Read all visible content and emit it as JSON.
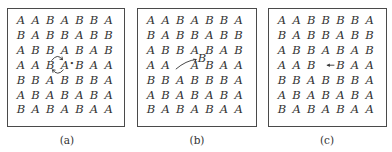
{
  "panels": [
    {
      "id": "a",
      "caption": "(a)",
      "description": "Direct exchange of neighboring B and A atoms (circular arrow)",
      "grid": [
        [
          "A",
          "A",
          "B",
          "A",
          "B",
          "B",
          "A"
        ],
        [
          "B",
          "A",
          "B",
          "B",
          "A",
          "B",
          "B"
        ],
        [
          "A",
          "B",
          "B",
          "A",
          "B",
          "A",
          "B"
        ],
        [
          "A",
          "A",
          "B",
          "A",
          "B",
          "A",
          "A"
        ],
        [
          "B",
          "B",
          "A",
          "B",
          "B",
          "B",
          "A"
        ],
        [
          "A",
          "B",
          "A",
          "B",
          "A",
          "B",
          "A"
        ],
        [
          "B",
          "A",
          "B",
          "A",
          "B",
          "A",
          "A"
        ]
      ],
      "marker": "•",
      "annotation": "exchange-arrow"
    },
    {
      "id": "b",
      "caption": "(b)",
      "description": "Interstitial mechanism: atom moves from lattice site to interstitial position",
      "grid": [
        [
          "A",
          "A",
          "B",
          "A",
          "B",
          "B",
          "A"
        ],
        [
          "B",
          "A",
          "B",
          "B",
          "A",
          "B",
          "B"
        ],
        [
          "A",
          "B",
          "B",
          "A",
          "B",
          "A",
          "B"
        ],
        [
          "A",
          "A",
          "",
          "A",
          "B",
          "A",
          "A"
        ],
        [
          "B",
          "B",
          "A",
          "B",
          "B",
          "B",
          "A"
        ],
        [
          "A",
          "B",
          "A",
          "B",
          "A",
          "B",
          "A"
        ],
        [
          "B",
          "A",
          "B",
          "A",
          "B",
          "A",
          "A"
        ]
      ],
      "interstitial": "B",
      "annotation": "interstitial-arrow"
    },
    {
      "id": "c",
      "caption": "(c)",
      "description": "Vacancy mechanism: B atom jumps into neighboring vacancy",
      "grid": [
        [
          "A",
          "A",
          "B",
          "B",
          "B",
          "B",
          "A"
        ],
        [
          "B",
          "A",
          "B",
          "B",
          "A",
          "B",
          "B"
        ],
        [
          "A",
          "B",
          "B",
          "A",
          "B",
          "A",
          "B"
        ],
        [
          "A",
          "A",
          "B",
          "",
          "B",
          "A",
          "A"
        ],
        [
          "B",
          "B",
          "A",
          "B",
          "B",
          "B",
          "A"
        ],
        [
          "A",
          "B",
          "A",
          "B",
          "A",
          "B",
          "A"
        ],
        [
          "B",
          "A",
          "B",
          "A",
          "B",
          "A",
          "A"
        ]
      ],
      "annotation": "vacancy-arrow"
    }
  ]
}
